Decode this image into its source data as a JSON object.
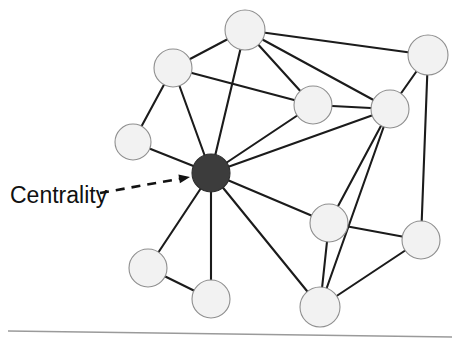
{
  "figure": {
    "width": 457,
    "height": 347,
    "background": "#ffffff",
    "baseline_rule": {
      "name": "bottom-divider",
      "x1": 8,
      "y1": 331,
      "x2": 452,
      "y2": 337,
      "color": "#9a9a9a"
    }
  },
  "annotation": {
    "label": "Centrality",
    "label_x": 10,
    "label_y": 203,
    "font_size": 23,
    "color": "#111111",
    "leader": {
      "name": "dashed-leader-line",
      "x1": 100,
      "y1": 193,
      "x2": 184,
      "y2": 178,
      "dash": "9 7",
      "arrow_tip_x": 190,
      "arrow_tip_y": 177
    }
  },
  "graph": {
    "type": "network-diagram",
    "node_radius": 19,
    "plain_fill": "#f2f2f2",
    "plain_stroke": "#8f8f8f",
    "highlight_fill": "#3c3c3c",
    "edge_color": "#1b1b1b",
    "nodes": [
      {
        "id": "n1",
        "label": "top-node",
        "x": 245,
        "y": 30,
        "r": 20,
        "kind": "plain"
      },
      {
        "id": "n2",
        "label": "upper-left-node",
        "x": 173,
        "y": 68,
        "r": 19,
        "kind": "plain"
      },
      {
        "id": "n3",
        "label": "top-right-node",
        "x": 428,
        "y": 55,
        "r": 20,
        "kind": "plain"
      },
      {
        "id": "n4",
        "label": "upper-mid-node",
        "x": 313,
        "y": 105,
        "r": 19,
        "kind": "plain"
      },
      {
        "id": "n5",
        "label": "right-upper-node",
        "x": 390,
        "y": 109,
        "r": 19,
        "kind": "plain"
      },
      {
        "id": "n6",
        "label": "left-node",
        "x": 133,
        "y": 142,
        "r": 18,
        "kind": "plain"
      },
      {
        "id": "n7",
        "label": "center-node",
        "x": 211,
        "y": 173,
        "r": 19,
        "kind": "highlight"
      },
      {
        "id": "n8",
        "label": "right-mid-node",
        "x": 329,
        "y": 223,
        "r": 19,
        "kind": "plain"
      },
      {
        "id": "n9",
        "label": "far-right-node",
        "x": 421,
        "y": 240,
        "r": 19,
        "kind": "plain"
      },
      {
        "id": "n10",
        "label": "lower-left-node",
        "x": 148,
        "y": 268,
        "r": 19,
        "kind": "plain"
      },
      {
        "id": "n11",
        "label": "bottom-left-node",
        "x": 211,
        "y": 299,
        "r": 19,
        "kind": "plain"
      },
      {
        "id": "n12",
        "label": "bottom-right-node",
        "x": 320,
        "y": 307,
        "r": 20,
        "kind": "plain"
      }
    ],
    "edges": [
      {
        "from": "n1",
        "to": "n2"
      },
      {
        "from": "n1",
        "to": "n3"
      },
      {
        "from": "n1",
        "to": "n4"
      },
      {
        "from": "n1",
        "to": "n5"
      },
      {
        "from": "n1",
        "to": "n7"
      },
      {
        "from": "n2",
        "to": "n4"
      },
      {
        "from": "n2",
        "to": "n6"
      },
      {
        "from": "n2",
        "to": "n7"
      },
      {
        "from": "n3",
        "to": "n5"
      },
      {
        "from": "n3",
        "to": "n9"
      },
      {
        "from": "n4",
        "to": "n5"
      },
      {
        "from": "n4",
        "to": "n7"
      },
      {
        "from": "n5",
        "to": "n7"
      },
      {
        "from": "n5",
        "to": "n8"
      },
      {
        "from": "n5",
        "to": "n12"
      },
      {
        "from": "n6",
        "to": "n7"
      },
      {
        "from": "n7",
        "to": "n8"
      },
      {
        "from": "n7",
        "to": "n10"
      },
      {
        "from": "n7",
        "to": "n11"
      },
      {
        "from": "n7",
        "to": "n12"
      },
      {
        "from": "n8",
        "to": "n9"
      },
      {
        "from": "n8",
        "to": "n12"
      },
      {
        "from": "n9",
        "to": "n12"
      },
      {
        "from": "n10",
        "to": "n11"
      }
    ]
  }
}
